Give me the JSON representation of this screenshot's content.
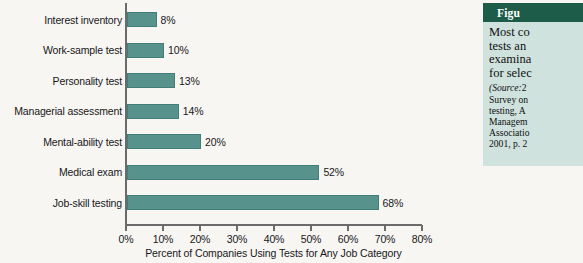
{
  "chart_data": {
    "type": "bar",
    "orientation": "horizontal",
    "title": "",
    "categories": [
      "Interest inventory",
      "Work-sample test",
      "Personality test",
      "Managerial assessment",
      "Mental-ability test",
      "Medical exam",
      "Job-skill testing"
    ],
    "values": [
      8,
      10,
      13,
      14,
      20,
      52,
      68
    ],
    "value_labels": [
      "8%",
      "10%",
      "13%",
      "14%",
      "20%",
      "52%",
      "68%"
    ],
    "xlabel": "Percent of Companies Using Tests for Any Job Category",
    "ylabel": "",
    "xlim": [
      0,
      80
    ],
    "xticks": [
      0,
      10,
      20,
      30,
      40,
      50,
      60,
      70,
      80
    ],
    "xtick_labels": [
      "0%",
      "10%",
      "20%",
      "30%",
      "40%",
      "50%",
      "60%",
      "70%",
      "80%"
    ],
    "grid": false,
    "legend": null,
    "bar_color": "#57938c",
    "bar_edge_color": "#3f7f77",
    "axis_color": "#6b6b6b",
    "background": "#f7f6f2"
  },
  "caption_panel": {
    "header_label": "Figu",
    "header_color": "#1c5c48",
    "panel_color": "#cfe2de",
    "body_lines": [
      "Most co",
      "tests an",
      "examina",
      "for selec"
    ],
    "source_prefix": "(Source:",
    "source_lines": [
      "2",
      "Survey on",
      "testing, A",
      "Managem",
      "Associatio",
      "2001, p. 2"
    ]
  }
}
